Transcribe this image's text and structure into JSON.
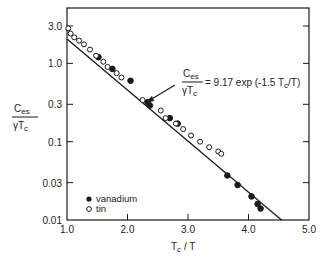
{
  "chart_data": {
    "type": "scatter",
    "title": "",
    "xlabel": "T_c / T",
    "ylabel": "C_es / (γ T_c)",
    "xscale": "linear",
    "yscale": "log",
    "xlim": [
      1.0,
      5.0
    ],
    "ylim": [
      0.01,
      3.0
    ],
    "xticks": [
      1.0,
      2.0,
      3.0,
      4.0,
      5.0
    ],
    "xtick_labels": [
      "1.0",
      "2.0",
      "3.0",
      "4.0",
      "5.0"
    ],
    "yticks": [
      3.0,
      1.0,
      0.3,
      0.1,
      0.03,
      0.01
    ],
    "ytick_labels": [
      "3.0",
      "1.0",
      "0.3",
      "0.1",
      "0.03",
      "0.01"
    ],
    "grid": false,
    "legend_position": "lower left",
    "series": [
      {
        "name": "vanadium",
        "marker": "filled-circle",
        "x": [
          1.52,
          1.75,
          2.05,
          2.33,
          2.37,
          2.7,
          2.83,
          3.65,
          3.82,
          4.05,
          4.15,
          4.2
        ],
        "y": [
          1.2,
          0.85,
          0.6,
          0.32,
          0.29,
          0.2,
          0.17,
          0.037,
          0.028,
          0.02,
          0.016,
          0.014
        ]
      },
      {
        "name": "tin",
        "marker": "open-circle",
        "x": [
          1.02,
          1.06,
          1.12,
          1.2,
          1.28,
          1.38,
          1.48,
          1.6,
          1.67,
          1.82,
          1.9,
          2.25,
          2.55,
          2.63,
          2.8,
          2.92,
          3.05,
          3.2,
          3.35,
          3.5,
          3.55
        ],
        "y": [
          2.8,
          2.4,
          2.15,
          1.95,
          1.75,
          1.5,
          1.25,
          1.05,
          0.9,
          0.75,
          0.66,
          0.34,
          0.25,
          0.2,
          0.17,
          0.145,
          0.12,
          0.1,
          0.085,
          0.075,
          0.07
        ]
      }
    ],
    "fit_line": {
      "equation": "C_es/(γT_c) = 9.17 exp(-1.5 T_c/T)",
      "a": 9.17,
      "b": -1.5,
      "x_range": [
        1.0,
        4.55
      ]
    },
    "annotations": [
      {
        "text": "Ces / γTc = 9.17 exp (-1.5 Tc/T)",
        "arrow_to": [
          2.35,
          0.31
        ]
      }
    ]
  },
  "labels": {
    "xlabel_main": "T",
    "xlabel_sub": "c",
    "xlabel_rest": " / T",
    "ylabel_num": "C",
    "ylabel_num_sub": "es",
    "ylabel_den": "γT",
    "ylabel_den_sub": "c",
    "legend_vanadium": "vanadium",
    "legend_tin": "tin",
    "ann_num": "C",
    "ann_num_sub": "es",
    "ann_den": "γT",
    "ann_den_sub": "c",
    "ann_rhs": "= 9.17 exp (-1.5 T",
    "ann_rhs_sub": "c",
    "ann_rhs_end": "/T)"
  },
  "colors": {
    "ink": "#1a1a1a",
    "background": "#ffffff"
  }
}
